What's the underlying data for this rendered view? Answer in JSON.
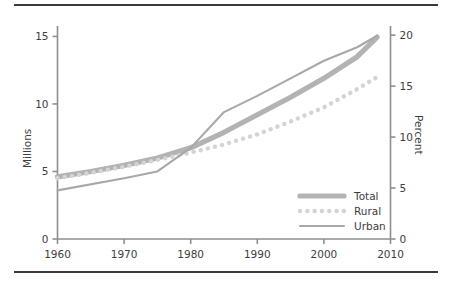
{
  "chart_data": {
    "type": "line",
    "title": "",
    "subtitle": "",
    "xlabel": "",
    "ylabel": "Millions",
    "y2label": "Percent",
    "xlim": [
      1960,
      2010
    ],
    "ylim": [
      0,
      15.7
    ],
    "y2lim": [
      0,
      20.8
    ],
    "grid": false,
    "legend_position": "lower-right",
    "x_ticks": [
      "1960",
      "1970",
      "1980",
      "1990",
      "2000",
      "2010"
    ],
    "x_tick_values": [
      1960,
      1970,
      1980,
      1990,
      2000,
      2010
    ],
    "y_ticks": [
      "0",
      "5",
      "10",
      "15"
    ],
    "y_tick_values": [
      0,
      5,
      10,
      15
    ],
    "y2_ticks": [
      "0",
      "5",
      "10",
      "15",
      "20"
    ],
    "y2_tick_values": [
      0,
      5,
      10,
      15,
      20
    ],
    "series": [
      {
        "name": "Total",
        "style": "thick-solid",
        "color": "#b3b3b3",
        "x": [
          1960,
          1965,
          1970,
          1975,
          1980,
          1985,
          1990,
          1995,
          2000,
          2005,
          2008
        ],
        "values": [
          4.6,
          5.0,
          5.45,
          6.0,
          6.75,
          7.9,
          9.2,
          10.5,
          11.9,
          13.5,
          14.95
        ]
      },
      {
        "name": "Rural",
        "style": "dotted",
        "color": "#d4d4d4",
        "x": [
          1960,
          1965,
          1970,
          1975,
          1980,
          1985,
          1990,
          1995,
          2000,
          2005,
          2008
        ],
        "values": [
          4.5,
          4.9,
          5.35,
          5.85,
          6.4,
          7.0,
          7.75,
          8.7,
          9.75,
          11.1,
          12.0
        ]
      },
      {
        "name": "Urban",
        "style": "thin-solid",
        "color": "#a8a8a8",
        "x": [
          1960,
          1970,
          1975,
          1980,
          1985,
          1990,
          1995,
          2000,
          2005,
          2008
        ],
        "values": [
          3.6,
          4.5,
          5.0,
          6.75,
          9.4,
          10.6,
          11.9,
          13.2,
          14.2,
          15.05
        ]
      }
    ]
  },
  "legend": {
    "entries": [
      {
        "label": "Total"
      },
      {
        "label": "Rural"
      },
      {
        "label": "Urban"
      }
    ]
  }
}
